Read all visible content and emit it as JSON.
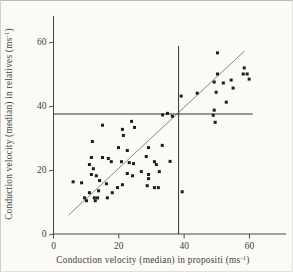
{
  "figure": {
    "background": "#fbfaf6",
    "caption": ""
  },
  "colors": {
    "points": "#1e1d1b",
    "axis": "#4a4944",
    "tick_text": "#3f3e3a",
    "reference_line": "#33322e",
    "diagonal_line": "#7a7974",
    "background": "#fbfaf6"
  },
  "chart_data": {
    "type": "scatter",
    "title": "",
    "xlabel": {
      "prefix": "Conduction velocity (median) in propositi (ms",
      "superscript": "-1",
      "suffix": ")"
    },
    "ylabel": {
      "prefix": "Conduction velocity (median) in relatives (ms",
      "superscript": "-1",
      "suffix": ")"
    },
    "xlim": [
      0,
      71
    ],
    "ylim": [
      0,
      68
    ],
    "xticks": [
      0,
      20,
      40,
      60
    ],
    "yticks": [
      0,
      20,
      40,
      60
    ],
    "grid": false,
    "legend": false,
    "marker": "small-filled-square",
    "reference_lines": [
      {
        "orientation": "horizontal",
        "value": 37.5,
        "from": 0,
        "to": 61
      },
      {
        "orientation": "vertical",
        "value": 38.3,
        "from": 0,
        "to": 58.8
      }
    ],
    "identity_line": {
      "x1": 4.6,
      "y1": 5.9,
      "x2": 58.5,
      "y2": 57.2
    },
    "points": [
      [
        15.0,
        34.0
      ],
      [
        11.9,
        28.9
      ],
      [
        19.9,
        27.0
      ],
      [
        15.0,
        23.9
      ],
      [
        16.8,
        23.6
      ],
      [
        17.7,
        22.6
      ],
      [
        11.0,
        21.7
      ],
      [
        11.6,
        23.9
      ],
      [
        12.2,
        20.4
      ],
      [
        23.9,
        35.2
      ],
      [
        21.1,
        32.7
      ],
      [
        24.8,
        33.3
      ],
      [
        21.4,
        30.8
      ],
      [
        29.1,
        27.0
      ],
      [
        33.3,
        27.7
      ],
      [
        22.6,
        26.1
      ],
      [
        28.4,
        24.2
      ],
      [
        20.8,
        22.6
      ],
      [
        23.2,
        22.3
      ],
      [
        24.5,
        22.0
      ],
      [
        30.9,
        22.6
      ],
      [
        31.5,
        21.7
      ],
      [
        35.7,
        22.7
      ],
      [
        26.9,
        19.5
      ],
      [
        32.4,
        19.5
      ],
      [
        36.4,
        36.8
      ],
      [
        34.9,
        37.7
      ],
      [
        33.4,
        37.2
      ],
      [
        11.6,
        18.6
      ],
      [
        13.1,
        18.2
      ],
      [
        6.0,
        16.3
      ],
      [
        8.6,
        16.0
      ],
      [
        14.1,
        16.7
      ],
      [
        16.2,
        15.7
      ],
      [
        11.0,
        12.9
      ],
      [
        13.8,
        13.5
      ],
      [
        18.0,
        12.9
      ],
      [
        19.6,
        14.5
      ],
      [
        16.5,
        11.3
      ],
      [
        9.5,
        11.3
      ],
      [
        10.1,
        10.4
      ],
      [
        12.5,
        11.3
      ],
      [
        13.5,
        11.3
      ],
      [
        12.8,
        10.4
      ],
      [
        22.6,
        18.9
      ],
      [
        24.2,
        18.2
      ],
      [
        29.1,
        18.6
      ],
      [
        29.1,
        17.3
      ],
      [
        21.1,
        15.4
      ],
      [
        28.7,
        15.1
      ],
      [
        30.9,
        14.5
      ],
      [
        32.1,
        14.5
      ],
      [
        39.4,
        13.2
      ],
      [
        39.1,
        43.1
      ],
      [
        44.0,
        44.0
      ],
      [
        50.2,
        56.6
      ],
      [
        58.4,
        51.9
      ],
      [
        58.1,
        50.0
      ],
      [
        59.3,
        50.0
      ],
      [
        59.9,
        48.4
      ],
      [
        50.2,
        50.0
      ],
      [
        49.2,
        47.5
      ],
      [
        52.0,
        47.2
      ],
      [
        54.4,
        48.1
      ],
      [
        55.0,
        45.6
      ],
      [
        49.8,
        44.3
      ],
      [
        52.9,
        41.2
      ],
      [
        49.2,
        38.7
      ],
      [
        48.9,
        37.1
      ],
      [
        49.5,
        34.9
      ]
    ]
  }
}
